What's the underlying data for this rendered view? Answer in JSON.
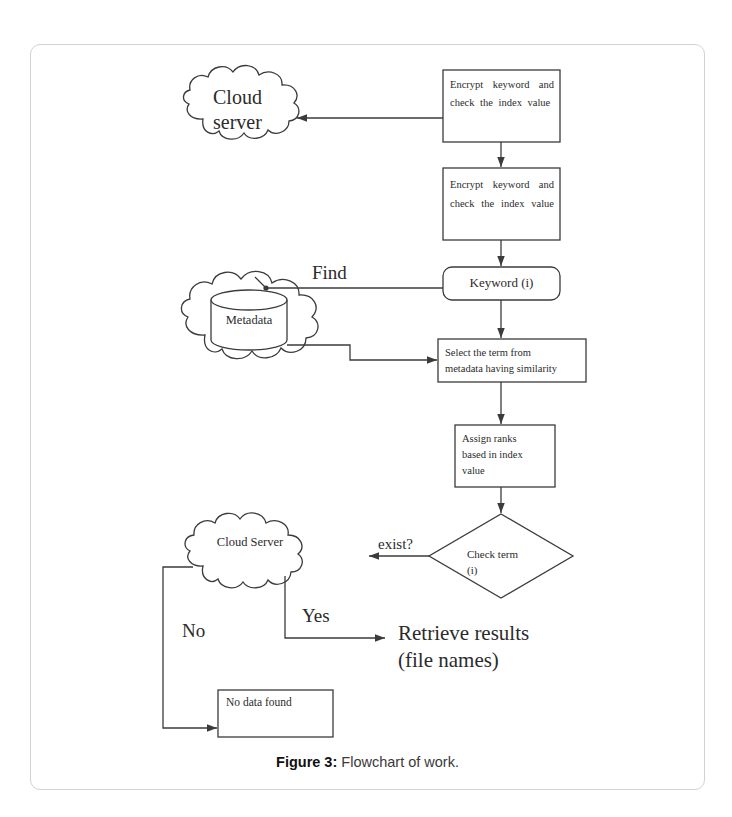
{
  "page": {
    "top_running_text": "",
    "caption_prefix": "Figure 3",
    "caption_separator": ":",
    "caption_text": "Flowchart of work."
  },
  "diagram": {
    "title": "Flowchart of work",
    "nodes": {
      "cloud_server_top": {
        "label": "Cloud\nserver",
        "line1": "Cloud",
        "line2": "server",
        "shape": "cloud"
      },
      "encrypt_box_1": {
        "label": "Encrypt keyword and check the index value",
        "shape": "rectangle"
      },
      "encrypt_box_2": {
        "label": "Encrypt keyword and check the index value",
        "shape": "rectangle"
      },
      "keyword_box": {
        "label": "Keyword (i)",
        "shape": "rounded-rectangle"
      },
      "metadata_store": {
        "label": "Metadata",
        "shape": "cylinder-in-cloud"
      },
      "select_term_box": {
        "line1": "Select the term from",
        "line2": "metadata having similarity",
        "shape": "rectangle"
      },
      "assign_ranks_box": {
        "line1": "Assign ranks",
        "line2": "based in index",
        "line3": "value",
        "shape": "rectangle"
      },
      "check_term_diamond": {
        "line1": "Check term",
        "line2": "(i)",
        "shape": "diamond"
      },
      "cloud_server_bottom": {
        "label": "Cloud Server",
        "shape": "cloud"
      },
      "retrieve_results": {
        "line1": "Retrieve results",
        "line2": "(file names)",
        "shape": "text"
      },
      "no_data_found_box": {
        "label": "No data found",
        "shape": "rectangle"
      }
    },
    "edge_labels": {
      "find": "Find",
      "exist": "exist?",
      "yes": "Yes",
      "no": "No"
    },
    "colors": {
      "stroke": "#3b3b3b",
      "frame": "#d2d2d6",
      "text": "#2b2b2b",
      "background": "#ffffff"
    }
  }
}
